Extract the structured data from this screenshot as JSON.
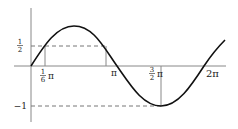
{
  "diagram": {
    "type": "function-graph",
    "function": "y = sin(x)",
    "x_range": [
      0,
      6.6
    ],
    "y_range": [
      -1,
      1
    ],
    "colors": {
      "curve": "#111111",
      "axes": "#888888",
      "guides": "#888888",
      "dashed": "#777777"
    },
    "y_ticks": [
      {
        "value": 0.5,
        "num": "1",
        "den": "2",
        "label": "1/2"
      },
      {
        "value": -1,
        "label": "−1"
      }
    ],
    "x_ticks": [
      {
        "value": 0.5236,
        "num": "1",
        "den": "6",
        "symbol": "π",
        "label": "1/6 π"
      },
      {
        "value": 3.1416,
        "symbol": "π",
        "label": "π"
      },
      {
        "value": 4.7124,
        "num": "3",
        "den": "2",
        "symbol": "π",
        "label": "3/2 π"
      },
      {
        "value": 6.2832,
        "label": "2π"
      }
    ],
    "guides": {
      "dashed_horizontal": [
        {
          "y": 0.5,
          "from_x": 0,
          "to_x": 2.618
        },
        {
          "y": -1,
          "from_x": 0,
          "to_x": 4.7124
        }
      ],
      "solid_vertical": [
        {
          "x": 0.5236,
          "from_y": 0,
          "to_y": 0.5
        },
        {
          "x": 2.618,
          "from_y": 0,
          "to_y": 0.5
        },
        {
          "x": 4.7124,
          "from_y": 0,
          "to_y": -1
        }
      ]
    },
    "labels": {
      "half_num": "1",
      "half_den": "2",
      "neg_one": "−1",
      "sixth_num": "1",
      "sixth_den": "6",
      "pi": "π",
      "pi_after_sixth": "π",
      "three_num": "3",
      "three_den": "2",
      "pi_after_three": "π",
      "two_pi": "2π"
    }
  }
}
